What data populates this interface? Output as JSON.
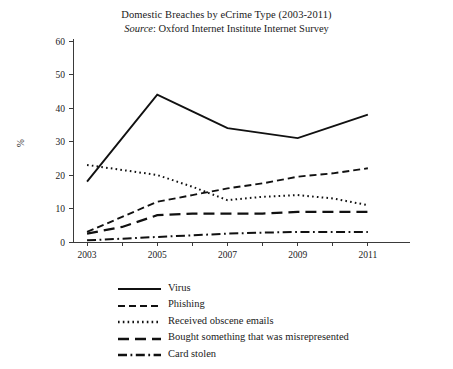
{
  "chart_data": {
    "type": "line",
    "title": "Domestic Breaches by eCrime Type (2003-2011)",
    "subtitle_prefix": "Source",
    "subtitle": ": Oxford Internet Institute Internet Survey",
    "subtitle_full": "Source: Oxford Internet Institute Internet Survey",
    "xlabel": "",
    "ylabel": "%",
    "x": [
      2003,
      2004,
      2005,
      2006,
      2007,
      2008,
      2009,
      2010,
      2011
    ],
    "xlim": [
      2002.6,
      2012.2
    ],
    "ylim": [
      0,
      60
    ],
    "yticks": [
      0,
      10,
      20,
      30,
      40,
      50,
      60
    ],
    "xticks": [
      2003,
      2004,
      2005,
      2006,
      2007,
      2008,
      2009,
      2010,
      2011
    ],
    "xtick_labels": [
      "2003",
      "",
      "2005",
      "",
      "2007",
      "",
      "2009",
      "",
      "2011"
    ],
    "grid": false,
    "legend_position": "below",
    "line_color": "#111111",
    "series": [
      {
        "name": "Virus",
        "style": "solid",
        "values": [
          18,
          31,
          44,
          39,
          34,
          32.5,
          31,
          34.5,
          38
        ]
      },
      {
        "name": "Phishing",
        "style": "dashed",
        "values": [
          3,
          7.5,
          12,
          14,
          16,
          17.5,
          19.5,
          20.5,
          22
        ]
      },
      {
        "name": "Received obscene emails",
        "style": "dotted",
        "values": [
          23,
          21.5,
          20,
          16.5,
          12.5,
          13.5,
          14,
          13,
          11
        ]
      },
      {
        "name": "Bought something that was misrepresented",
        "style": "longdash",
        "values": [
          2.5,
          4.5,
          8,
          8.5,
          8.5,
          8.5,
          9,
          9,
          9
        ]
      },
      {
        "name": "Card stolen",
        "style": "dashdot",
        "values": [
          0.5,
          1,
          1.5,
          2,
          2.5,
          2.8,
          3,
          3,
          3
        ]
      }
    ]
  },
  "legend": {
    "items": [
      {
        "label": "Virus",
        "style": "solid"
      },
      {
        "label": "Phishing",
        "style": "dashed"
      },
      {
        "label": "Received obscene emails",
        "style": "dotted"
      },
      {
        "label": "Bought something that was misrepresented",
        "style": "longdash"
      },
      {
        "label": "Card stolen",
        "style": "dashdot"
      }
    ]
  }
}
